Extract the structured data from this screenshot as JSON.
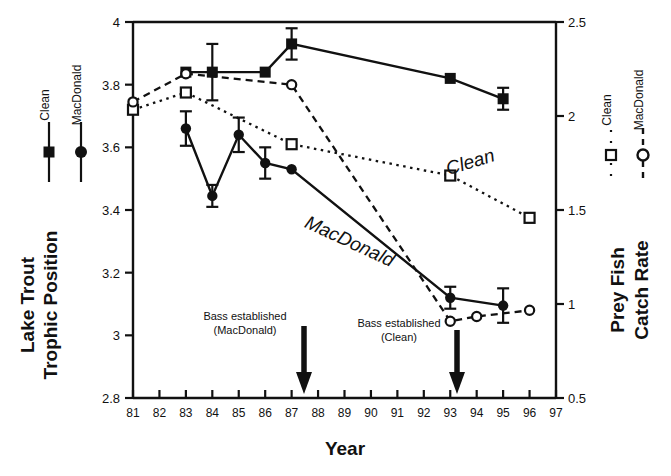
{
  "chart_data": {
    "type": "line",
    "title": "",
    "xlabel": "Year",
    "ylabel_left": "Lake Trout Trophic Position",
    "ylabel_right": "Prey Fish Catch Rate",
    "xlim": [
      81,
      97
    ],
    "xticks": [
      "81",
      "82",
      "83",
      "84",
      "85",
      "86",
      "87",
      "88",
      "89",
      "90",
      "91",
      "92",
      "93",
      "94",
      "95",
      "96",
      "97"
    ],
    "ylim_left": [
      2.8,
      4.0
    ],
    "yticks_left": [
      "2.8",
      "3",
      "3.2",
      "3.4",
      "3.6",
      "3.8",
      "4"
    ],
    "ylim_right": [
      0.5,
      2.5
    ],
    "yticks_right": [
      "0.5",
      "1",
      "1.5",
      "2",
      "2.5"
    ],
    "grid": false,
    "legend_position": "outside-left-and-right",
    "series": [
      {
        "name": "Clean",
        "axis": "left",
        "marker": "filled-square",
        "line": "solid",
        "legend_group": "Lake Trout Trophic Position",
        "points": [
          {
            "x": 83,
            "y": 3.84,
            "err": 0.0
          },
          {
            "x": 84,
            "y": 3.84,
            "err": 0.09
          },
          {
            "x": 86,
            "y": 3.84,
            "err": 0.0
          },
          {
            "x": 87,
            "y": 3.93,
            "err": 0.05
          },
          {
            "x": 93,
            "y": 3.82,
            "err": 0.0
          },
          {
            "x": 95,
            "y": 3.755,
            "err": 0.035
          }
        ]
      },
      {
        "name": "MacDonald",
        "axis": "left",
        "marker": "filled-circle",
        "line": "solid",
        "legend_group": "Lake Trout Trophic Position",
        "points": [
          {
            "x": 83,
            "y": 3.66,
            "err": 0.055
          },
          {
            "x": 84,
            "y": 3.445,
            "err": 0.035
          },
          {
            "x": 85,
            "y": 3.64,
            "err": 0.055
          },
          {
            "x": 86,
            "y": 3.55,
            "err": 0.05
          },
          {
            "x": 87,
            "y": 3.53,
            "err": 0.0
          },
          {
            "x": 93,
            "y": 3.12,
            "err": 0.035
          },
          {
            "x": 95,
            "y": 3.095,
            "err": 0.055
          }
        ]
      },
      {
        "name": "Clean",
        "axis": "right",
        "marker": "open-square",
        "line": "dotted",
        "legend_group": "Prey Fish Catch Rate",
        "points": [
          {
            "x": 81,
            "y_left": 3.72
          },
          {
            "x": 83,
            "y_left": 3.775
          },
          {
            "x": 87,
            "y_left": 3.61
          },
          {
            "x": 93,
            "y_left": 3.51
          },
          {
            "x": 96,
            "y_left": 3.375
          }
        ]
      },
      {
        "name": "MacDonald",
        "axis": "right",
        "marker": "open-circle",
        "line": "dashed",
        "legend_group": "Prey Fish Catch Rate",
        "points": [
          {
            "x": 81,
            "y_left": 3.745
          },
          {
            "x": 83,
            "y_left": 3.835
          },
          {
            "x": 87,
            "y_left": 3.8
          },
          {
            "x": 93,
            "y_left": 3.045
          },
          {
            "x": 94,
            "y_left": 3.06
          },
          {
            "x": 96,
            "y_left": 3.08
          }
        ]
      }
    ],
    "annotations": [
      {
        "id": "ann-macdonald",
        "line1": "Bass established",
        "line2": "(MacDonald)",
        "arrow_x": 87
      },
      {
        "id": "ann-clean",
        "line1": "Bass established",
        "line2": "(Clean)",
        "arrow_x": 93
      }
    ],
    "inplot_labels": [
      {
        "id": "label-clean",
        "text": "Clean"
      },
      {
        "id": "label-macdonald",
        "text": "MacDonald"
      }
    ]
  },
  "legend_left": {
    "items": [
      {
        "label": "Clean",
        "marker": "filled-square"
      },
      {
        "label": "MacDonald",
        "marker": "filled-circle"
      }
    ]
  },
  "legend_right": {
    "items": [
      {
        "label": "Clean",
        "marker": "open-square"
      },
      {
        "label": "MacDonald",
        "marker": "open-circle"
      }
    ]
  },
  "axis_titles": {
    "left_line1": "Lake Trout",
    "left_line2": "Trophic Position",
    "right_line1": "Prey Fish",
    "right_line2": "Catch Rate",
    "bottom": "Year"
  },
  "colors": {
    "ink": "#111111",
    "background": "#ffffff"
  }
}
